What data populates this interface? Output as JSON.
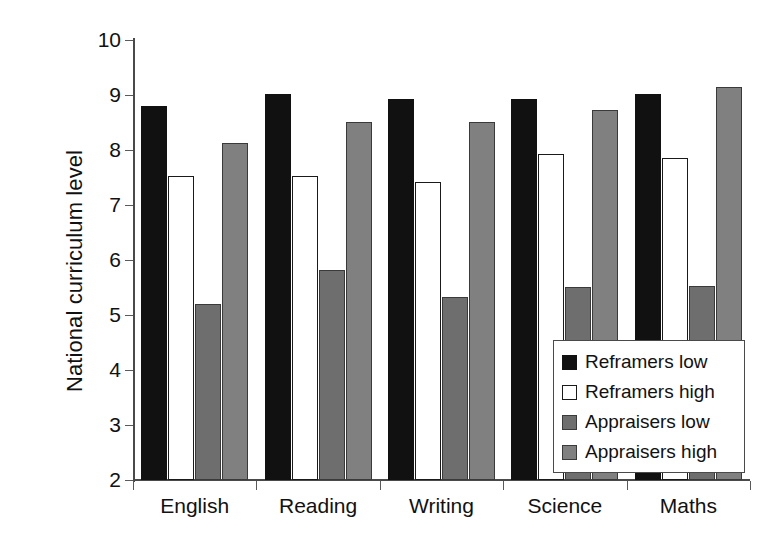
{
  "chart_data": {
    "type": "bar",
    "title": "",
    "subtitle": "",
    "xlabel": "",
    "ylabel": "National curriculum level",
    "categories": [
      "English",
      "Reading",
      "Writing",
      "Science",
      "Maths"
    ],
    "series": [
      {
        "name": "Reframers low",
        "color": "#111111",
        "values": [
          8.8,
          9.02,
          8.92,
          8.93,
          9.02
        ]
      },
      {
        "name": "Reframers high",
        "color": "#ffffff",
        "values": [
          7.52,
          7.52,
          7.41,
          7.93,
          7.85
        ]
      },
      {
        "name": "Appraisers low",
        "color": "#6e6e6e",
        "values": [
          5.2,
          5.81,
          5.32,
          5.51,
          5.52
        ]
      },
      {
        "name": "Appraisers high",
        "color": "#808080",
        "values": [
          8.12,
          8.51,
          8.51,
          8.72,
          9.14
        ]
      }
    ],
    "ylim": [
      2,
      10
    ],
    "ytick_step": 1,
    "yticks": [
      10,
      9,
      8,
      7,
      6,
      5,
      4,
      3,
      2
    ],
    "ytick_labels": [
      "10",
      "9",
      "8",
      "7",
      "6",
      "5",
      "4",
      "3",
      "2"
    ],
    "grid": false,
    "legend_position": "bottom-right-inside",
    "legend_entries": [
      "Reframers low",
      "Reframers high",
      "Appraisers low",
      "Appraisers high"
    ]
  },
  "axes": {
    "y_title": "National curriculum level"
  }
}
